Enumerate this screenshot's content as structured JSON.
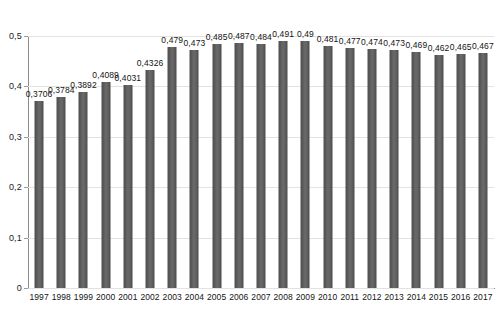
{
  "chart_data": {
    "type": "bar",
    "title": "",
    "xlabel": "",
    "ylabel": "",
    "categories": [
      "1997",
      "1998",
      "1999",
      "2000",
      "2001",
      "2002",
      "2003",
      "2004",
      "2005",
      "2006",
      "2007",
      "2008",
      "2009",
      "2010",
      "2011",
      "2012",
      "2013",
      "2014",
      "2015",
      "2016",
      "2017"
    ],
    "values": [
      0.3706,
      0.3784,
      0.3892,
      0.4089,
      0.4031,
      0.4326,
      0.479,
      0.473,
      0.485,
      0.487,
      0.484,
      0.491,
      0.49,
      0.481,
      0.477,
      0.474,
      0.473,
      0.469,
      0.462,
      0.465,
      0.467
    ],
    "value_labels": [
      "0,3706",
      "0,3784",
      "0,3892",
      "0,4089",
      "0,4031",
      "0,4326",
      "0,479",
      "0,473",
      "0,485",
      "0,487",
      "0,484",
      "0,491",
      "0,49",
      "0,481",
      "0,477",
      "0,474",
      "0,473",
      "0,469",
      "0,462",
      "0,465",
      "0,467"
    ],
    "ylim": [
      0,
      0.5
    ],
    "ytick_values": [
      0,
      0.1,
      0.2,
      0.3,
      0.4,
      0.5
    ],
    "ytick_labels": [
      "0",
      "0,1",
      "0,2",
      "0,3",
      "0,4",
      "0,5"
    ],
    "grid": true,
    "legend": "none",
    "decimal_separator": ",",
    "series_name": "",
    "bar_color": "#5c5c5c",
    "gridline_color": "#e2e2e2",
    "axis_color": "#8c8c8c",
    "background_color": "#ffffff",
    "label_color": "#141414"
  }
}
